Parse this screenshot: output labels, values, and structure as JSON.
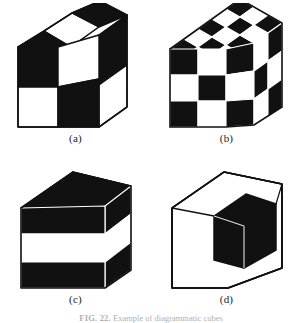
{
  "figure": {
    "caption_tag": "FIG. 22.",
    "caption_text": "Example of diagrammatic cubes",
    "colors": {
      "black": "#111111",
      "white": "#ffffff",
      "outline": "#111111",
      "seam": "#ffffff",
      "page_background": "#ffffff"
    },
    "panels": [
      {
        "id": "a",
        "label": "(a)",
        "description": "2x2x2 checkerboard cube",
        "divisions": 2,
        "faces": {
          "front": [
            [
              "black",
              "white"
            ],
            [
              "white",
              "black"
            ]
          ],
          "top": [
            [
              "white",
              "black"
            ],
            [
              "black",
              "white"
            ]
          ],
          "right": [
            [
              "black",
              "white"
            ],
            [
              "white",
              "black"
            ]
          ]
        }
      },
      {
        "id": "b",
        "label": "(b)",
        "description": "3x3x3 checkerboard cube",
        "divisions": 3,
        "faces": {
          "front": [
            [
              "black",
              "white",
              "black"
            ],
            [
              "white",
              "black",
              "white"
            ],
            [
              "black",
              "white",
              "black"
            ]
          ],
          "top": [
            [
              "black",
              "white",
              "black"
            ],
            [
              "white",
              "black",
              "white"
            ],
            [
              "black",
              "white",
              "black"
            ]
          ],
          "right": [
            [
              "black",
              "white",
              "black"
            ],
            [
              "white",
              "black",
              "white"
            ],
            [
              "black",
              "white",
              "black"
            ]
          ]
        }
      },
      {
        "id": "c",
        "label": "(c)",
        "description": "Cube with horizontal slab stripes",
        "divisions": 3,
        "faces": {
          "front": [
            [
              "black",
              "black",
              "black"
            ],
            [
              "white",
              "white",
              "white"
            ],
            [
              "black",
              "black",
              "black"
            ]
          ],
          "top": [
            [
              "black",
              "black",
              "black"
            ],
            [
              "black",
              "black",
              "black"
            ],
            [
              "black",
              "black",
              "black"
            ]
          ],
          "right": [
            [
              "black",
              "black",
              "black"
            ],
            [
              "white",
              "white",
              "white"
            ],
            [
              "black",
              "black",
              "black"
            ]
          ]
        }
      },
      {
        "id": "d",
        "label": "(d)",
        "description": "Outline cube with one black octant notch",
        "divisions": 2,
        "faces": {
          "front": [
            [
              "white",
              "black"
            ],
            [
              "white",
              "white"
            ]
          ],
          "top": [
            [
              "white",
              "white"
            ],
            [
              "white",
              "white"
            ]
          ],
          "right": [
            [
              "black",
              "black"
            ],
            [
              "white",
              "white"
            ]
          ]
        }
      }
    ]
  }
}
